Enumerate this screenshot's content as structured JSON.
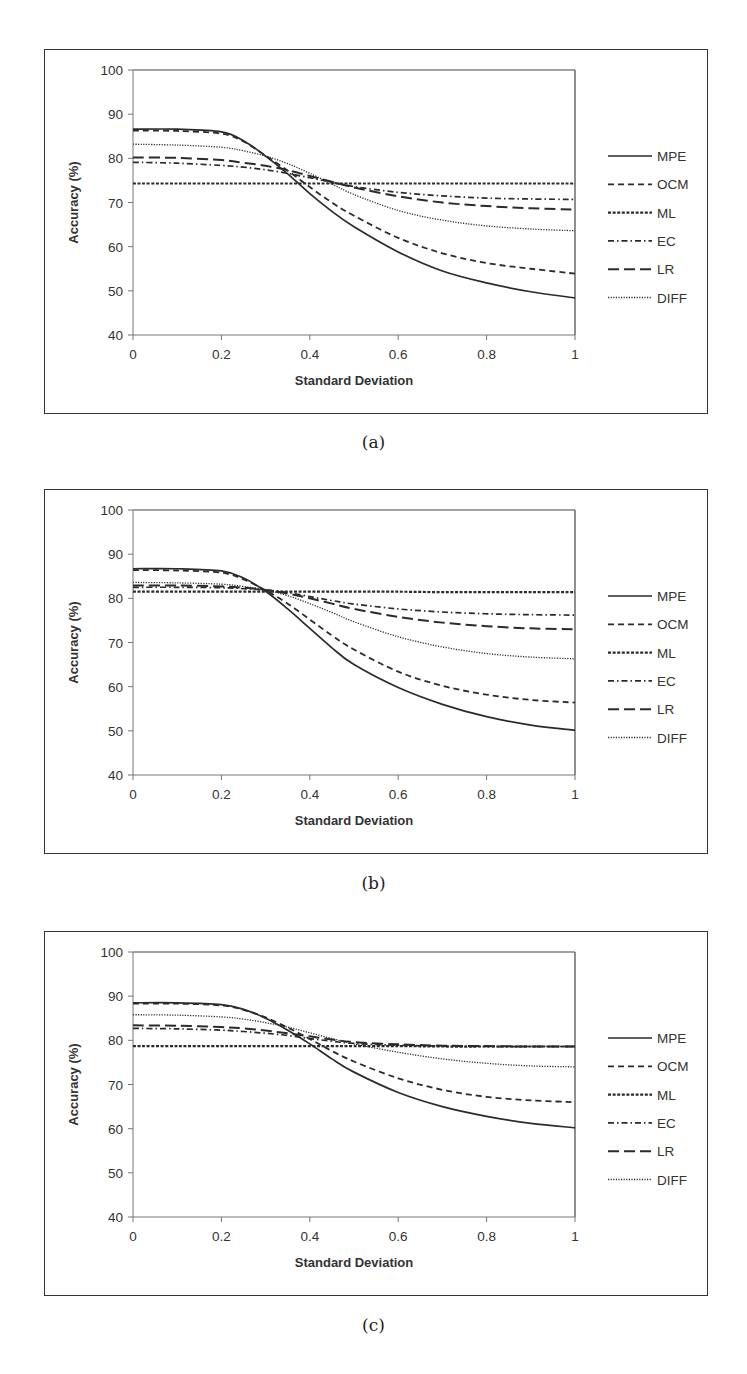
{
  "chart_data": [
    {
      "id": "a",
      "type": "line",
      "caption": "(a)",
      "title": "",
      "xlabel": "Standard Deviation",
      "ylabel": "Accuracy (%)",
      "xlim": [
        0,
        1
      ],
      "ylim": [
        40,
        100
      ],
      "x_ticks": [
        "0",
        "0.2",
        "0.4",
        "0.6",
        "0.8",
        "1"
      ],
      "y_ticks": [
        "40",
        "50",
        "60",
        "70",
        "80",
        "90",
        "100"
      ],
      "grid": false,
      "legend_position": "right",
      "x": [
        0,
        0.1,
        0.2,
        0.25,
        0.3,
        0.35,
        0.4,
        0.45,
        0.5,
        0.6,
        0.7,
        0.8,
        0.9,
        1.0
      ],
      "series": [
        {
          "name": "MPE",
          "style": "solid",
          "values": [
            86.6,
            86.6,
            86.0,
            84.0,
            80.5,
            76.5,
            72.0,
            68.0,
            64.5,
            58.8,
            54.5,
            51.8,
            49.8,
            48.4
          ]
        },
        {
          "name": "OCM",
          "style": "dashed",
          "values": [
            86.3,
            86.2,
            85.6,
            83.8,
            80.6,
            77.2,
            73.5,
            70.0,
            67.0,
            62.0,
            58.5,
            56.3,
            55.0,
            53.9
          ]
        },
        {
          "name": "ML",
          "style": "dense-dashed",
          "values": [
            74.3,
            74.3,
            74.3,
            74.3,
            74.3,
            74.3,
            74.3,
            74.3,
            74.3,
            74.3,
            74.3,
            74.3,
            74.3,
            74.3
          ]
        },
        {
          "name": "EC",
          "style": "dash-dot",
          "values": [
            79.1,
            78.9,
            78.4,
            78.0,
            77.4,
            76.6,
            75.6,
            74.6,
            73.6,
            72.3,
            71.5,
            71.0,
            70.8,
            70.7
          ]
        },
        {
          "name": "LR",
          "style": "long-dash",
          "values": [
            80.2,
            80.1,
            79.6,
            79.0,
            78.3,
            77.3,
            76.0,
            74.7,
            73.4,
            71.4,
            70.0,
            69.2,
            68.7,
            68.4
          ]
        },
        {
          "name": "DIFF",
          "style": "dotted",
          "values": [
            83.2,
            83.0,
            82.5,
            81.7,
            80.5,
            78.8,
            76.6,
            74.2,
            71.8,
            68.2,
            66.0,
            64.7,
            64.0,
            63.6
          ]
        }
      ]
    },
    {
      "id": "b",
      "type": "line",
      "caption": "(b)",
      "title": "",
      "xlabel": "Standard Deviation",
      "ylabel": "Accuracy (%)",
      "xlim": [
        0,
        1
      ],
      "ylim": [
        40,
        100
      ],
      "x_ticks": [
        "0",
        "0.2",
        "0.4",
        "0.6",
        "0.8",
        "1"
      ],
      "y_ticks": [
        "40",
        "50",
        "60",
        "70",
        "80",
        "90",
        "100"
      ],
      "grid": false,
      "legend_position": "right",
      "x": [
        0,
        0.1,
        0.2,
        0.25,
        0.3,
        0.35,
        0.4,
        0.45,
        0.5,
        0.6,
        0.7,
        0.8,
        0.9,
        1.0
      ],
      "series": [
        {
          "name": "MPE",
          "style": "solid",
          "values": [
            86.7,
            86.7,
            86.2,
            84.6,
            81.6,
            77.6,
            73.2,
            68.8,
            65.0,
            59.8,
            56.0,
            53.2,
            51.3,
            50.1
          ]
        },
        {
          "name": "OCM",
          "style": "dashed",
          "values": [
            86.4,
            86.3,
            85.8,
            84.3,
            81.8,
            78.8,
            75.2,
            71.6,
            68.4,
            63.4,
            60.2,
            58.2,
            57.0,
            56.4
          ]
        },
        {
          "name": "ML",
          "style": "dense-dashed",
          "values": [
            81.5,
            81.5,
            81.5,
            81.5,
            81.5,
            81.5,
            81.5,
            81.5,
            81.5,
            81.5,
            81.4,
            81.4,
            81.4,
            81.4
          ]
        },
        {
          "name": "EC",
          "style": "dash-dot",
          "values": [
            82.5,
            82.5,
            82.4,
            82.2,
            81.9,
            81.3,
            80.4,
            79.5,
            78.7,
            77.6,
            76.9,
            76.5,
            76.3,
            76.2
          ]
        },
        {
          "name": "LR",
          "style": "long-dash",
          "values": [
            82.9,
            82.9,
            82.7,
            82.4,
            81.9,
            81.1,
            80.0,
            78.8,
            77.6,
            75.8,
            74.5,
            73.7,
            73.2,
            73.0
          ]
        },
        {
          "name": "DIFF",
          "style": "dotted",
          "values": [
            83.6,
            83.5,
            83.2,
            82.7,
            81.9,
            80.6,
            78.8,
            76.8,
            74.7,
            71.3,
            69.0,
            67.5,
            66.7,
            66.3
          ]
        }
      ]
    },
    {
      "id": "c",
      "type": "line",
      "caption": "(c)",
      "title": "",
      "xlabel": "Standard Deviation",
      "ylabel": "Accuracy (%)",
      "xlim": [
        0,
        1
      ],
      "ylim": [
        40,
        100
      ],
      "x_ticks": [
        "0",
        "0.2",
        "0.4",
        "0.6",
        "0.8",
        "1"
      ],
      "y_ticks": [
        "40",
        "50",
        "60",
        "70",
        "80",
        "90",
        "100"
      ],
      "grid": false,
      "legend_position": "right",
      "x": [
        0,
        0.1,
        0.2,
        0.25,
        0.3,
        0.35,
        0.4,
        0.45,
        0.5,
        0.6,
        0.7,
        0.8,
        0.9,
        1.0
      ],
      "series": [
        {
          "name": "MPE",
          "style": "solid",
          "values": [
            88.5,
            88.5,
            88.1,
            87.0,
            85.0,
            82.3,
            79.2,
            75.8,
            72.8,
            68.2,
            65.0,
            62.8,
            61.2,
            60.2
          ]
        },
        {
          "name": "OCM",
          "style": "dashed",
          "values": [
            88.3,
            88.3,
            87.9,
            86.9,
            85.2,
            82.9,
            80.3,
            77.6,
            75.2,
            71.4,
            68.8,
            67.2,
            66.4,
            66.0
          ]
        },
        {
          "name": "ML",
          "style": "dense-dashed",
          "values": [
            78.7,
            78.7,
            78.7,
            78.7,
            78.7,
            78.7,
            78.7,
            78.7,
            78.7,
            78.7,
            78.6,
            78.6,
            78.6,
            78.6
          ]
        },
        {
          "name": "EC",
          "style": "dash-dot",
          "values": [
            82.7,
            82.6,
            82.3,
            82.0,
            81.6,
            81.1,
            80.4,
            79.8,
            79.3,
            78.9,
            78.7,
            78.6,
            78.6,
            78.6
          ]
        },
        {
          "name": "LR",
          "style": "long-dash",
          "values": [
            83.4,
            83.3,
            83.0,
            82.7,
            82.2,
            81.6,
            80.9,
            80.2,
            79.6,
            79.1,
            78.8,
            78.7,
            78.6,
            78.6
          ]
        },
        {
          "name": "DIFF",
          "style": "dotted",
          "values": [
            85.8,
            85.7,
            85.3,
            84.8,
            84.0,
            83.0,
            81.7,
            80.4,
            79.2,
            77.3,
            75.8,
            74.8,
            74.2,
            74.0
          ]
        }
      ]
    }
  ],
  "panels": [
    {
      "caption": "(a)"
    },
    {
      "caption": "(b)"
    },
    {
      "caption": "(c)"
    }
  ],
  "styles": {
    "line_color": "#2b2b2b",
    "axis_color": "#777777",
    "frame_color": "#333333"
  }
}
